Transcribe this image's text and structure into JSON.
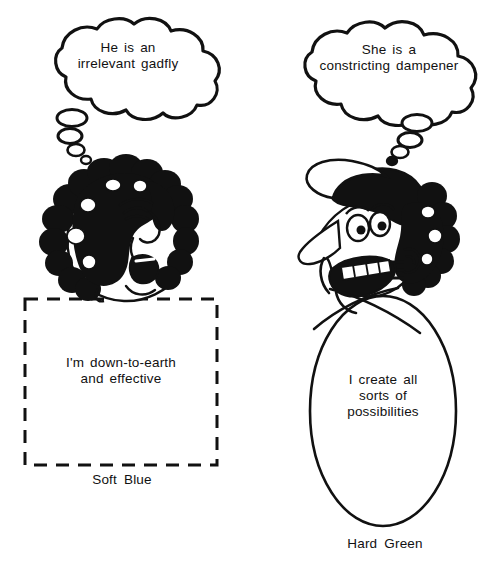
{
  "page": {
    "background_color": "#ffffff",
    "ink_color": "#111111",
    "width": 502,
    "height": 568
  },
  "left_panel": {
    "caption": "Soft Blue",
    "thought_bubble": {
      "icon": "thought-bubble-icon",
      "text": "He is an\nirrelevant gadfly"
    },
    "character": {
      "icon": "curly-haired-face-icon",
      "description": "curly-haired shouting face facing right"
    },
    "shape": {
      "icon": "dashed-rectangle-icon",
      "style": "dashed",
      "border_color": "#111111"
    },
    "self_statement": "I'm down-to-earth\nand effective"
  },
  "right_panel": {
    "caption": "Hard Green",
    "thought_bubble": {
      "icon": "thought-bubble-icon",
      "text": "She is a\nconstricting dampener"
    },
    "character": {
      "icon": "cap-wearing-grinning-face-icon",
      "description": "long-nosed grinning face with cap, facing left"
    },
    "shape": {
      "icon": "oval-outline-icon",
      "style": "solid",
      "border_color": "#111111"
    },
    "self_statement": "I create all\nsorts of\npossibilities"
  }
}
